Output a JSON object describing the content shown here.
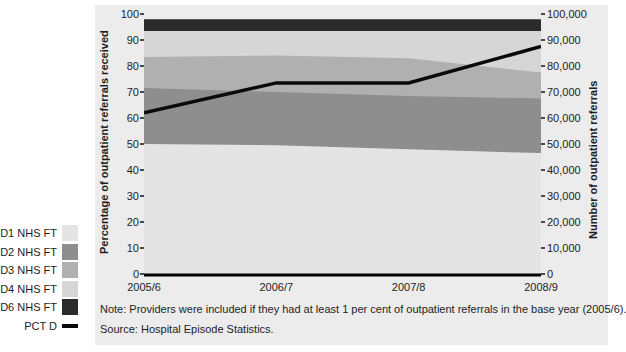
{
  "figure": {
    "note": "Note: Providers were included if they had at least 1 per cent of outpatient referrals in the base year (2005/6).",
    "source": "Source: Hospital Episode Statistics."
  },
  "legend": {
    "items": [
      {
        "label": "D1 NHS FT",
        "color": "#e4e4e4",
        "type": "box"
      },
      {
        "label": "D2 NHS FT",
        "color": "#8e8e8e",
        "type": "box"
      },
      {
        "label": "D3 NHS FT",
        "color": "#b0b0b0",
        "type": "box"
      },
      {
        "label": "D4 NHS FT",
        "color": "#d6d6d6",
        "type": "box"
      },
      {
        "label": "D6 NHS FT",
        "color": "#2b2b2b",
        "type": "box"
      },
      {
        "label": "PCT D",
        "color": "#0a0a0a",
        "type": "line"
      }
    ]
  },
  "chart_data": {
    "type": "area",
    "stacked": true,
    "title": "",
    "x_categories": [
      "2005/6",
      "2006/7",
      "2007/8",
      "2008/9"
    ],
    "left_axis": {
      "label": "Percentage of outpatient referrals received",
      "range": [
        0,
        100
      ],
      "tick_step": 10,
      "ticks": [
        "100",
        "90",
        "80",
        "70",
        "60",
        "50",
        "40",
        "30",
        "20",
        "10",
        "0"
      ]
    },
    "right_axis": {
      "label": "Number of outpatient referrals",
      "range": [
        0,
        100000
      ],
      "tick_step": 10000,
      "ticks": [
        "100,000",
        "90,000",
        "80,000",
        "70,000",
        "60,000",
        "50,000",
        "40,000",
        "30,000",
        "20,000",
        "10,000",
        "0"
      ]
    },
    "layers": [
      {
        "name": "D1 NHS FT",
        "color": "#e4e4e4",
        "cumulative_top_pct": [
          50,
          49.5,
          48,
          46.5
        ]
      },
      {
        "name": "D2 NHS FT",
        "color": "#8e8e8e",
        "cumulative_top_pct": [
          71.5,
          70,
          68.5,
          67.5
        ]
      },
      {
        "name": "D3 NHS FT",
        "color": "#b0b0b0",
        "cumulative_top_pct": [
          83.5,
          84,
          83,
          77.5
        ]
      },
      {
        "name": "D4 NHS FT",
        "color": "#d6d6d6",
        "cumulative_top_pct": [
          93.5,
          93.5,
          93.5,
          93.5
        ]
      },
      {
        "name": "D6 NHS FT",
        "color": "#2b2b2b",
        "cumulative_top_pct": [
          98,
          98,
          98,
          98
        ]
      }
    ],
    "line_series": {
      "name": "PCT D",
      "color": "#0a0a0a",
      "values_pct": [
        62,
        73.5,
        73.5,
        87.5
      ]
    },
    "plot_background": "#ececec",
    "axis_line_color": "#000000",
    "grid": false,
    "legend_position": "left-outside"
  }
}
